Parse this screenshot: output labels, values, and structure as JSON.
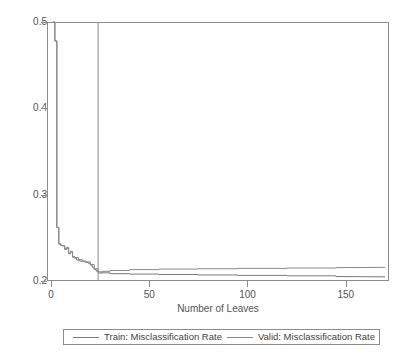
{
  "chart_data": {
    "type": "line",
    "title": "",
    "xlabel": "Number of Leaves",
    "ylabel": "",
    "xlim": [
      -2,
      172
    ],
    "ylim": [
      0.2,
      0.5
    ],
    "grid": false,
    "legend_position": "bottom",
    "xticks": [
      0,
      50,
      100,
      150
    ],
    "xtick_labels": [
      "0",
      "50",
      "100",
      "150"
    ],
    "yticks": [
      0.2,
      0.3,
      0.4,
      0.5
    ],
    "ytick_labels": [
      "0.2",
      "0.3",
      "0.4",
      "0.5"
    ],
    "annotations": [
      {
        "name": "selected-model-reference-line",
        "type": "vline",
        "x": 24,
        "label": ""
      }
    ],
    "series": [
      {
        "name": "Train: Misclassification Rate",
        "color": "#7a7a7a",
        "x": [
          1,
          2,
          2,
          3,
          3,
          4,
          4,
          5,
          5,
          6,
          6,
          7,
          7,
          8,
          8,
          9,
          9,
          10,
          10,
          11,
          11,
          12,
          12,
          13,
          13,
          14,
          14,
          15,
          15,
          16,
          16,
          17,
          17,
          18,
          18,
          19,
          19,
          20,
          20,
          21,
          21,
          22,
          22,
          23,
          23,
          24,
          24,
          26,
          26,
          30,
          30,
          40,
          40,
          55,
          55,
          75,
          75,
          95,
          95,
          120,
          120,
          145,
          145,
          170
        ],
        "y": [
          0.5,
          0.5,
          0.478,
          0.478,
          0.262,
          0.262,
          0.243,
          0.243,
          0.241,
          0.241,
          0.2405,
          0.2405,
          0.2365,
          0.2365,
          0.238,
          0.238,
          0.2315,
          0.2315,
          0.2335,
          0.2335,
          0.2275,
          0.2275,
          0.2265,
          0.2265,
          0.2245,
          0.2245,
          0.2235,
          0.2235,
          0.2228,
          0.2228,
          0.2225,
          0.2225,
          0.222,
          0.222,
          0.2215,
          0.2215,
          0.2205,
          0.2205,
          0.2185,
          0.2185,
          0.216,
          0.216,
          0.2135,
          0.2135,
          0.2115,
          0.2115,
          0.2105,
          0.2105,
          0.2095,
          0.2095,
          0.2085,
          0.2085,
          0.208,
          0.208,
          0.2075,
          0.2075,
          0.207,
          0.207,
          0.2065,
          0.2065,
          0.206,
          0.206,
          0.2052,
          0.2048
        ]
      },
      {
        "name": "Valid: Misclassification Rate",
        "color": "#8a8a8a",
        "x": [
          1,
          2,
          2,
          3,
          3,
          4,
          4,
          5,
          5,
          6,
          6,
          7,
          7,
          8,
          8,
          9,
          9,
          10,
          10,
          11,
          11,
          12,
          12,
          14,
          14,
          16,
          16,
          18,
          18,
          20,
          20,
          22,
          22,
          24,
          24,
          26,
          26,
          30,
          30,
          40,
          40,
          55,
          55,
          75,
          75,
          95,
          95,
          120,
          120,
          145,
          145,
          170
        ],
        "y": [
          0.5,
          0.5,
          0.478,
          0.478,
          0.262,
          0.262,
          0.243,
          0.243,
          0.2415,
          0.2415,
          0.2412,
          0.2412,
          0.2375,
          0.2375,
          0.239,
          0.239,
          0.2325,
          0.2325,
          0.2345,
          0.2345,
          0.2285,
          0.2285,
          0.2272,
          0.2272,
          0.2248,
          0.2248,
          0.2232,
          0.2232,
          0.2222,
          0.2222,
          0.2192,
          0.2192,
          0.2142,
          0.2142,
          0.2092,
          0.2092,
          0.2112,
          0.2112,
          0.2122,
          0.2122,
          0.2132,
          0.2132,
          0.2138,
          0.2138,
          0.2142,
          0.2142,
          0.2146,
          0.2146,
          0.215,
          0.215,
          0.2155,
          0.2158
        ]
      }
    ]
  },
  "legend": {
    "entries": [
      {
        "label": "Train: Misclassification Rate"
      },
      {
        "label": "Valid: Misclassification Rate"
      }
    ]
  }
}
